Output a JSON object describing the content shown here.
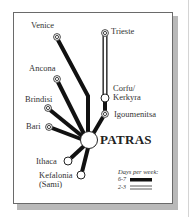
{
  "hub": {
    "name": "PATRAS"
  },
  "ports": [
    {
      "id": "venice",
      "name": "Venice",
      "frequency": "6-7"
    },
    {
      "id": "trieste",
      "name": "Trieste",
      "frequency": "2-3"
    },
    {
      "id": "ancona",
      "name": "Ancona",
      "frequency": "6-7"
    },
    {
      "id": "corfu",
      "name": "Corfu/\nKerkyra",
      "line1": "Corfu/",
      "line2": "Kerkyra",
      "frequency": "6-7"
    },
    {
      "id": "brindisi",
      "name": "Brindisi",
      "frequency": "6-7"
    },
    {
      "id": "igoumenitsa",
      "name": "Igoumenitsa",
      "frequency": "6-7"
    },
    {
      "id": "bari",
      "name": "Bari",
      "frequency": "6-7"
    },
    {
      "id": "ithaca",
      "name": "Ithaca",
      "frequency": "6-7"
    },
    {
      "id": "kefalonia",
      "name": "Kefalonia (Sami)",
      "line1": "Kefalonia",
      "line2": "(Sami)",
      "frequency": "6-7"
    }
  ],
  "legend": {
    "title": "Days per week:",
    "items": [
      {
        "label": "6-7",
        "style": "solid-thick"
      },
      {
        "label": "2-3",
        "style": "double-line"
      }
    ]
  },
  "colors": {
    "route": "#111111",
    "node_fill": "#ffffff",
    "frame_border": "#6a6a6a",
    "shadow": "#b9b9b9"
  }
}
